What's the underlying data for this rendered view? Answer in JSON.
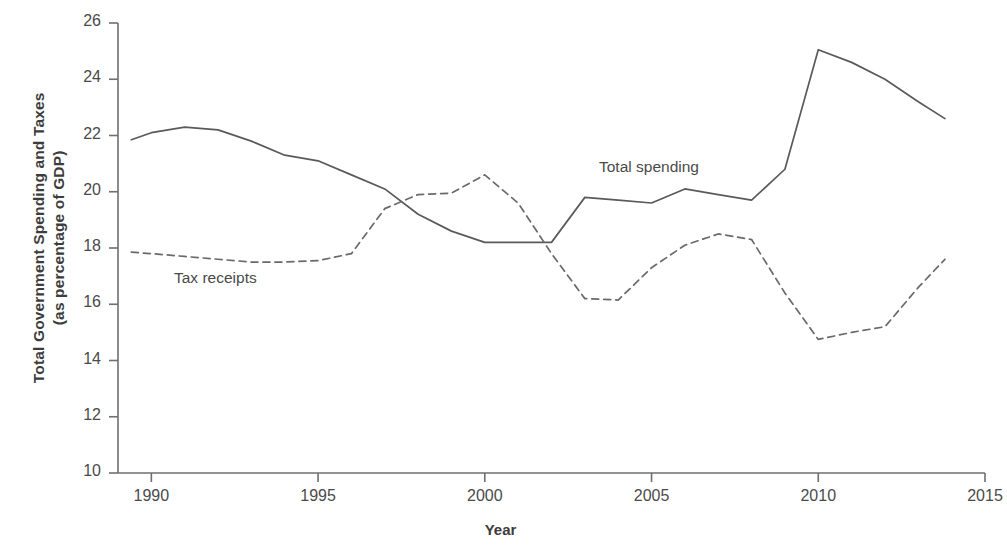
{
  "chart_data": {
    "type": "line",
    "title": "",
    "xlabel": "Year",
    "ylabel": "Total Government Spending and Taxes (as percentage of GDP)",
    "ylabel_line1": "Total Government Spending and Taxes",
    "ylabel_line2": "(as percentage of GDP)",
    "xlim": [
      1989,
      2015
    ],
    "ylim": [
      10,
      26
    ],
    "xticks": [
      1990,
      1995,
      2000,
      2005,
      2010,
      2015
    ],
    "xtick_labels": [
      "1990",
      "1995",
      "2000",
      "2005",
      "2010",
      "2015"
    ],
    "yticks": [
      10,
      12,
      14,
      16,
      18,
      20,
      22,
      24,
      26
    ],
    "ytick_labels": [
      "10",
      "12",
      "14",
      "16",
      "18",
      "20",
      "22",
      "24",
      "26"
    ],
    "grid": false,
    "legend_position": "inline-annotation",
    "x": [
      1989.4,
      1990,
      1991,
      1992,
      1993,
      1994,
      1995,
      1996,
      1997,
      1998,
      1999,
      2000,
      2001,
      2002,
      2003,
      2004,
      2005,
      2006,
      2007,
      2008,
      2009,
      2010,
      2011,
      2012,
      2013,
      2013.8
    ],
    "series": [
      {
        "name": "Total spending",
        "style": "solid",
        "color": "#5a5a5a",
        "values": [
          21.85,
          22.1,
          22.3,
          22.2,
          21.8,
          21.3,
          21.1,
          20.6,
          20.1,
          19.2,
          18.6,
          18.2,
          18.2,
          18.2,
          19.8,
          19.7,
          19.6,
          20.1,
          19.9,
          19.7,
          20.8,
          25.05,
          24.6,
          24.0,
          23.2,
          22.6
        ]
      },
      {
        "name": "Tax receipts",
        "style": "dashed",
        "color": "#6a6a6a",
        "values": [
          17.85,
          17.8,
          17.7,
          17.6,
          17.5,
          17.5,
          17.55,
          17.8,
          19.4,
          19.9,
          19.95,
          20.6,
          19.6,
          17.8,
          16.2,
          16.15,
          17.3,
          18.1,
          18.5,
          18.3,
          16.4,
          14.75,
          15.0,
          15.2,
          16.6,
          17.6
        ]
      }
    ],
    "annotations": [
      {
        "text": "Total spending",
        "x": 2006.0,
        "y": 21.2
      },
      {
        "text": "Tax receipts",
        "x": 1991.0,
        "y": 17.0
      }
    ]
  },
  "axes": {
    "ylabel_line1": "Total Government Spending and Taxes",
    "ylabel_line2": "(as percentage of GDP)",
    "xlabel": "Year"
  },
  "labels": {
    "total_spending": "Total spending",
    "tax_receipts": "Tax receipts"
  },
  "colors": {
    "axis": "#6b6b6b",
    "spending_line": "#5a5a5a",
    "tax_line": "#6a6a6a",
    "text": "#3c3c3c",
    "background": "#ffffff"
  }
}
